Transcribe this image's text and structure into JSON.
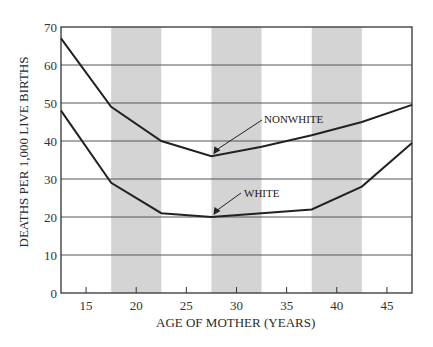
{
  "chart_data": {
    "type": "line",
    "title": "",
    "xlabel": "AGE OF MOTHER (YEARS)",
    "ylabel": "DEATHS PER 1,000 LIVE BIRTHS",
    "xlim": [
      12.5,
      47.5
    ],
    "ylim": [
      0,
      70
    ],
    "x_ticks": [
      15,
      20,
      25,
      30,
      35,
      40,
      45
    ],
    "y_ticks": [
      0,
      10,
      20,
      30,
      40,
      50,
      60,
      70
    ],
    "grid": "horizontal",
    "shaded_bands": [
      [
        17.5,
        22.5
      ],
      [
        27.5,
        32.5
      ],
      [
        37.5,
        42.5
      ]
    ],
    "x": [
      12.5,
      17.5,
      22.5,
      27.5,
      32.5,
      37.5,
      42.5,
      47.5
    ],
    "series": [
      {
        "name": "NONWHITE",
        "values": [
          67,
          49,
          40,
          36,
          38.5,
          41.5,
          45,
          49.5
        ]
      },
      {
        "name": "WHITE",
        "values": [
          48,
          29,
          21,
          20,
          21,
          22,
          28,
          39.5
        ]
      }
    ],
    "annotations": [
      {
        "text": "NONWHITE",
        "points_to": [
          27.5,
          36
        ]
      },
      {
        "text": "WHITE",
        "points_to": [
          27.5,
          20
        ]
      }
    ]
  }
}
